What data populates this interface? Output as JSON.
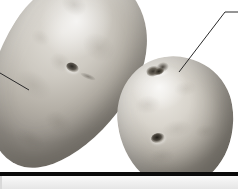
{
  "figure": {
    "kind": "photograph-crop",
    "background_color": "#ffffff",
    "lower_panel_color": "#eeeeee",
    "rule_color": "#0b0b0b"
  },
  "specimens": [
    {
      "id": "potato-left",
      "label": "",
      "shape": "elongated oval tuber",
      "orientation_degrees": 32,
      "skin_color": "#c8c3ba",
      "shadow_color": "#7d7871",
      "cropped_at_top": true,
      "eyes": [
        {
          "id": "eye-left-center",
          "position": "mid-body",
          "color": "#2d2a26"
        },
        {
          "id": "eye-left-lower",
          "position": "below-center crease",
          "color": "#5a554d"
        }
      ]
    },
    {
      "id": "potato-right",
      "label": "",
      "shape": "rounded tuber",
      "orientation_degrees": -8,
      "skin_color": "#cfcac2",
      "shadow_color": "#6e6a63",
      "cropped_at_bottom": true,
      "eyes": [
        {
          "id": "eye-right-crown",
          "position": "crown cluster",
          "color": "#3a362f"
        },
        {
          "id": "eye-right-bud",
          "position": "crown bud",
          "color": "#242119"
        },
        {
          "id": "eye-right-center",
          "position": "mid-body",
          "color": "#201d18"
        }
      ]
    }
  ],
  "annotations": {
    "leaders": [
      {
        "id": "leader-left",
        "label": "",
        "points_to": "potato-left mid-body surface",
        "from": {
          "x": 0,
          "y": 73
        },
        "to": {
          "x": 29,
          "y": 90
        },
        "color": "#2a2a2a"
      },
      {
        "id": "leader-right",
        "label": "",
        "points_to": "potato-right crown eye cluster",
        "elbow": {
          "x": 225,
          "y": 12
        },
        "from": {
          "x": 238,
          "y": 12
        },
        "to": {
          "x": 179,
          "y": 72
        },
        "color": "#2a2a2a"
      }
    ]
  },
  "rule": {
    "id": "plate-divider",
    "y": 172,
    "height": 4,
    "width": 238
  }
}
